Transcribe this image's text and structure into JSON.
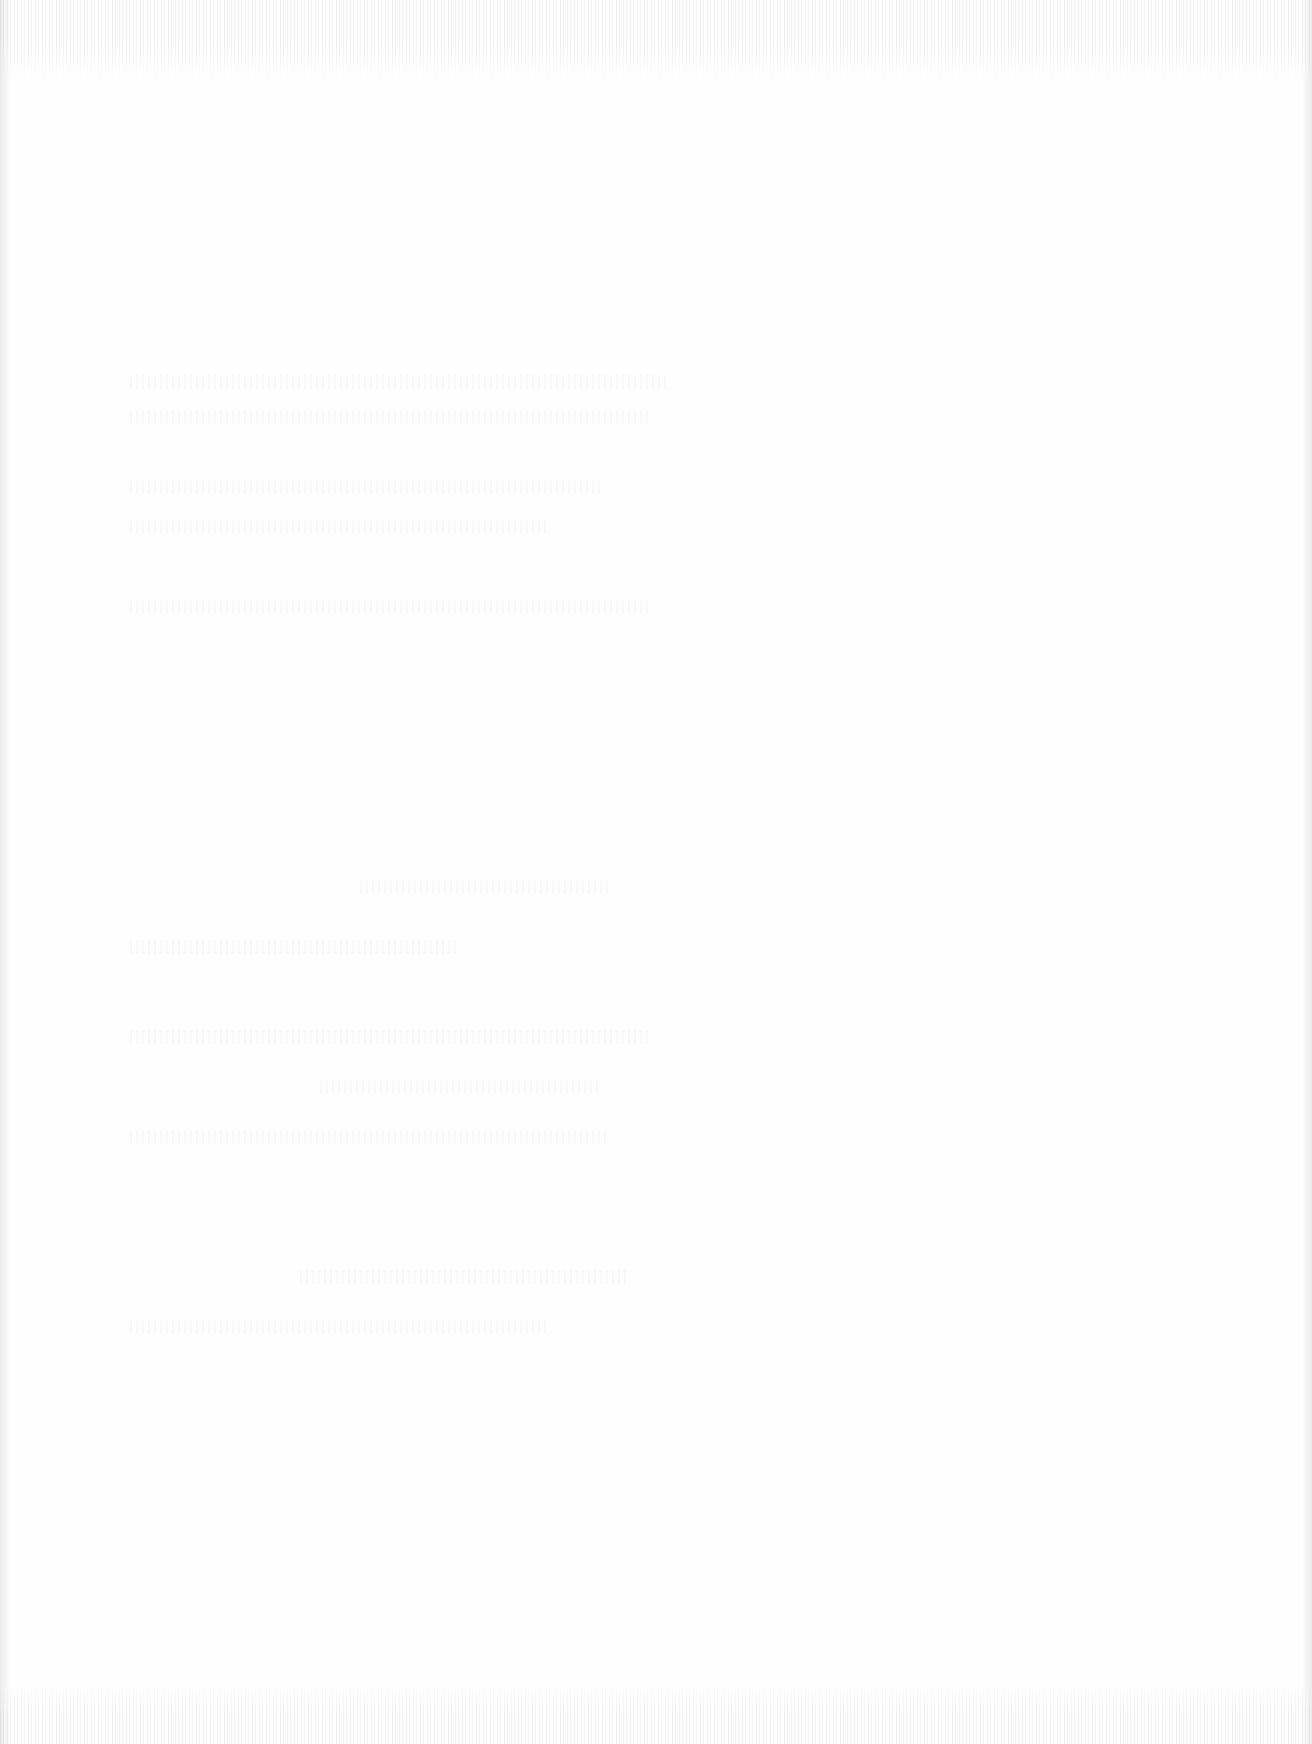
{
  "document": {
    "type": "blank scanned page",
    "visible_text": []
  },
  "ghost_lines": [
    {
      "left": 130,
      "top": 375,
      "width": 540
    },
    {
      "left": 130,
      "top": 410,
      "width": 520
    },
    {
      "left": 130,
      "top": 480,
      "width": 470
    },
    {
      "left": 130,
      "top": 520,
      "width": 420
    },
    {
      "left": 130,
      "top": 600,
      "width": 520
    },
    {
      "left": 360,
      "top": 880,
      "width": 250
    },
    {
      "left": 130,
      "top": 940,
      "width": 330
    },
    {
      "left": 130,
      "top": 1030,
      "width": 520
    },
    {
      "left": 320,
      "top": 1080,
      "width": 280
    },
    {
      "left": 130,
      "top": 1130,
      "width": 480
    },
    {
      "left": 300,
      "top": 1270,
      "width": 330
    },
    {
      "left": 130,
      "top": 1320,
      "width": 420
    }
  ],
  "colors": {
    "paper": "#fefefe"
  }
}
